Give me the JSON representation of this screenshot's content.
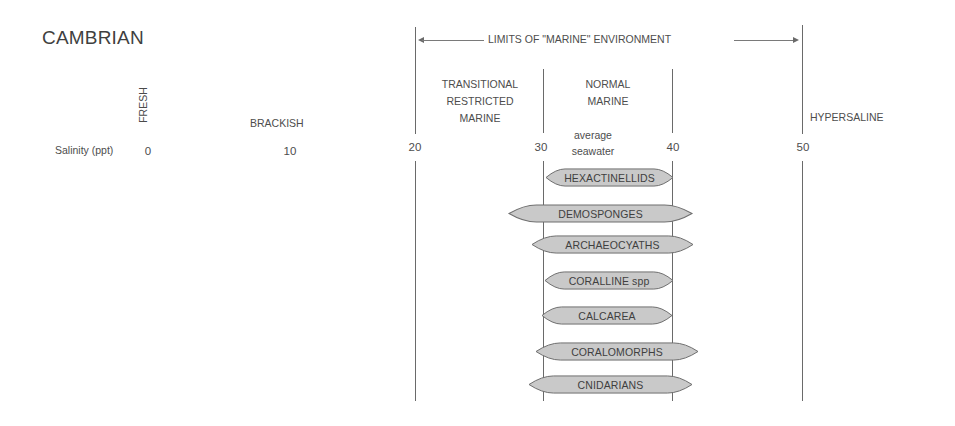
{
  "title": "CAMBRIAN",
  "limits_label": "LIMITS OF \"MARINE\" ENVIRONMENT",
  "axis": {
    "label": "Salinity (ppt)",
    "ticks": [
      "0",
      "10",
      "20",
      "30",
      "40",
      "50"
    ]
  },
  "zones": {
    "fresh": "FRESH",
    "brackish": "BRACKISH",
    "transitional": [
      "TRANSITIONAL",
      "RESTRICTED",
      "MARINE"
    ],
    "normal": [
      "NORMAL",
      "MARINE"
    ],
    "average": [
      "average",
      "seawater"
    ],
    "hypersaline": "HYPERSALINE"
  },
  "taxa": [
    {
      "name": "HEXACTINELLIDS",
      "min_ppt": 30,
      "max_ppt": 40
    },
    {
      "name": "DEMOSPONGES",
      "min_ppt": 27.5,
      "max_ppt": 41.5
    },
    {
      "name": "ARCHAEOCYATHS",
      "min_ppt": 29,
      "max_ppt": 41.5
    },
    {
      "name": "CORALLINE spp",
      "min_ppt": 30,
      "max_ppt": 40
    },
    {
      "name": "CALCAREA",
      "min_ppt": 30,
      "max_ppt": 40
    },
    {
      "name": "CORALOMORPHS",
      "min_ppt": 29.5,
      "max_ppt": 42
    },
    {
      "name": "CNIDARIANS",
      "min_ppt": 29,
      "max_ppt": 41.5
    }
  ],
  "colors": {
    "shape_fill": "#c9c9c9",
    "shape_stroke": "#6f6f6f",
    "line": "#6a6a6a"
  }
}
